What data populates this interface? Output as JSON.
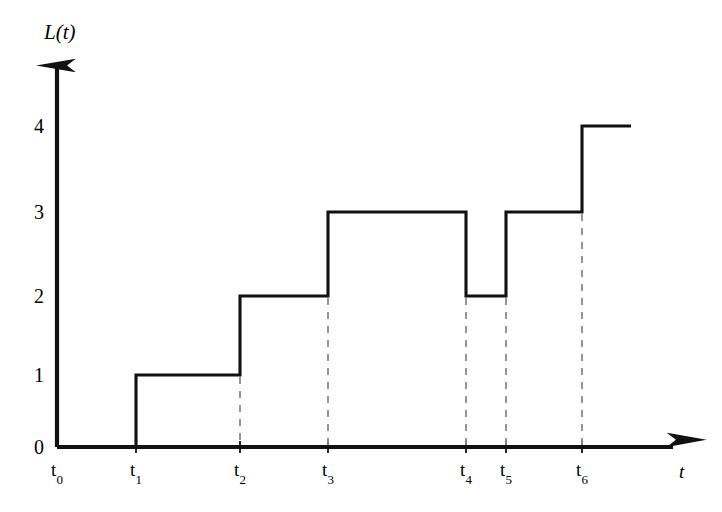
{
  "chart_data": {
    "type": "line",
    "subtype": "step-function",
    "title": "",
    "xlabel": "t",
    "ylabel": "L(t)",
    "grid": false,
    "legend": null,
    "xlim": [
      0,
      7.9
    ],
    "ylim": [
      0,
      5.1
    ],
    "x_tick_labels": [
      "t0",
      "t1",
      "t2",
      "t3",
      "t4",
      "t5",
      "t6"
    ],
    "x_tick_bases": [
      "t",
      "t",
      "t",
      "t",
      "t",
      "t",
      "t"
    ],
    "x_tick_subscripts": [
      "0",
      "1",
      "2",
      "3",
      "4",
      "5",
      "6"
    ],
    "x_tick_positions_px": [
      57,
      136,
      240,
      328,
      466,
      506,
      582
    ],
    "y_tick_labels": [
      "0",
      "1",
      "2",
      "3",
      "4"
    ],
    "y_tick_values": [
      0,
      1,
      2,
      3,
      4
    ],
    "y_tick_positions_px": [
      447,
      375,
      296,
      212,
      126
    ],
    "step_points": [
      {
        "x_label": "t0",
        "x_px": 57,
        "value": 0
      },
      {
        "x_label": "t1",
        "x_px": 136,
        "value": 1
      },
      {
        "x_label": "t2",
        "x_px": 240,
        "value": 2
      },
      {
        "x_label": "t3",
        "x_px": 328,
        "value": 3
      },
      {
        "x_label": "t4",
        "x_px": 466,
        "value": 2
      },
      {
        "x_label": "t5",
        "x_px": 506,
        "value": 3
      },
      {
        "x_label": "t6",
        "x_px": 582,
        "value": 4
      }
    ],
    "step_end_x_px": 631,
    "dropline_x_labels": [
      "t2",
      "t3",
      "t4",
      "t5",
      "t6"
    ],
    "dropline_x_px": [
      240,
      328,
      466,
      506,
      582
    ],
    "axis_color": "#111111",
    "curve_color": "#111111",
    "dropline_color": "#8a8a8a",
    "background_color": "#ffffff"
  },
  "axes": {
    "y_title": "L(t)",
    "x_title": "t",
    "y_axis_x_px": 57,
    "y_axis_top_px": 55,
    "x_axis_y_px": 447,
    "x_axis_right_px": 685
  }
}
